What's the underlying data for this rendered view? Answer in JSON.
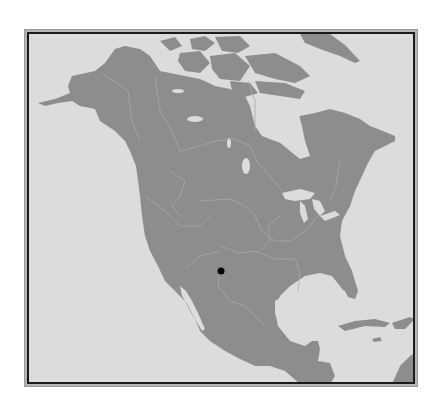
{
  "map": {
    "region": "North America",
    "colors": {
      "sea": "#dcdcdc",
      "land": "#8d8d8d",
      "border": "#a9a9a9",
      "frame": "#1a1a1a",
      "marker": "#000000"
    },
    "markers": [
      {
        "name": "location-marker",
        "x": 221,
        "y": 270,
        "radius": 4
      }
    ],
    "visible_regions": [
      "Alaska",
      "Canada",
      "Greenland",
      "Arctic Archipelago",
      "United States",
      "Mexico",
      "Central America",
      "Cuba",
      "Caribbean",
      "Hudson Bay",
      "Gulf of Mexico",
      "Great Lakes"
    ]
  }
}
